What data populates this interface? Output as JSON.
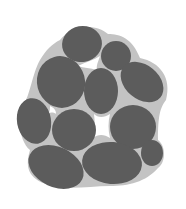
{
  "diagram": {
    "type": "particle-packing",
    "colors": {
      "background": "#ffffff",
      "matrix": "#c3c3c3",
      "particle": "#5c5c5c",
      "void": "#ffffff"
    },
    "matrix_hull": "M60,40 C70,26 95,22 108,34 C120,34 132,38 140,58 C160,62 172,78 166,100 C160,108 158,116 158,140 C166,146 166,162 158,168 C146,182 128,186 110,186 C90,186 72,190 52,186 C30,180 24,170 30,150 C18,140 16,110 26,100 C30,92 34,70 40,60 C46,50 52,44 60,40 Z",
    "particles": [
      {
        "id": "p1",
        "cx": 82,
        "cy": 44,
        "rx": 20,
        "ry": 18,
        "rot": -10
      },
      {
        "id": "p2",
        "cx": 116,
        "cy": 56,
        "rx": 15,
        "ry": 15,
        "rot": 0
      },
      {
        "id": "p3",
        "cx": 61,
        "cy": 82,
        "rx": 24,
        "ry": 26,
        "rot": -15
      },
      {
        "id": "p4",
        "cx": 101,
        "cy": 91,
        "rx": 17,
        "ry": 23,
        "rot": 0
      },
      {
        "id": "p5",
        "cx": 142,
        "cy": 82,
        "rx": 24,
        "ry": 17,
        "rot": 40
      },
      {
        "id": "p6",
        "cx": 34,
        "cy": 121,
        "rx": 17,
        "ry": 23,
        "rot": -10
      },
      {
        "id": "p7",
        "cx": 74,
        "cy": 130,
        "rx": 22,
        "ry": 21,
        "rot": 0
      },
      {
        "id": "p8",
        "cx": 133,
        "cy": 127,
        "rx": 23,
        "ry": 22,
        "rot": 0
      },
      {
        "id": "p9",
        "cx": 56,
        "cy": 167,
        "rx": 29,
        "ry": 20,
        "rot": 25
      },
      {
        "id": "p10",
        "cx": 112,
        "cy": 163,
        "rx": 30,
        "ry": 21,
        "rot": 5
      },
      {
        "id": "p11",
        "cx": 152,
        "cy": 153,
        "rx": 11,
        "ry": 13,
        "rot": 0
      }
    ]
  }
}
